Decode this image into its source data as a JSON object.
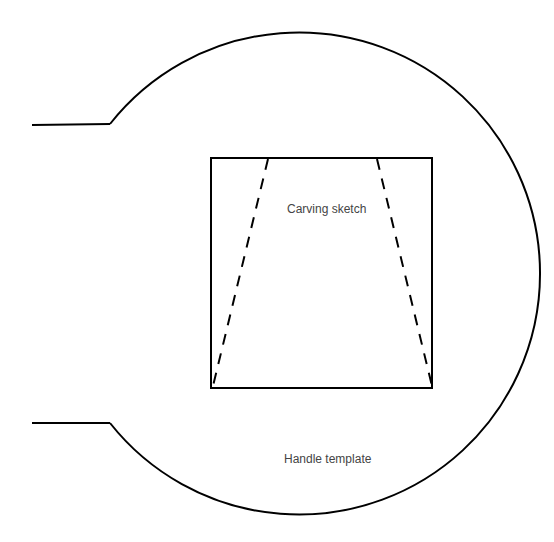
{
  "diagram": {
    "labels": {
      "carving": "Carving sketch",
      "handle": "Handle template"
    },
    "colors": {
      "stroke": "#000000",
      "text": "#444444",
      "background": "#ffffff"
    },
    "shapes": {
      "circle": {
        "cx": 296,
        "cy": 273,
        "r": 241
      },
      "stem_top": {
        "x1": 32,
        "y1": 125,
        "x2": 110,
        "y2": 124
      },
      "stem_bottom": {
        "x1": 32,
        "y1": 423,
        "x2": 110,
        "y2": 423
      },
      "square": {
        "x": 211,
        "y": 158,
        "w": 221,
        "h": 230
      },
      "dashed_left": {
        "x1": 268,
        "y1": 158,
        "x2": 213,
        "y2": 387
      },
      "dashed_right": {
        "x1": 377,
        "y1": 158,
        "x2": 432,
        "y2": 386
      }
    }
  }
}
